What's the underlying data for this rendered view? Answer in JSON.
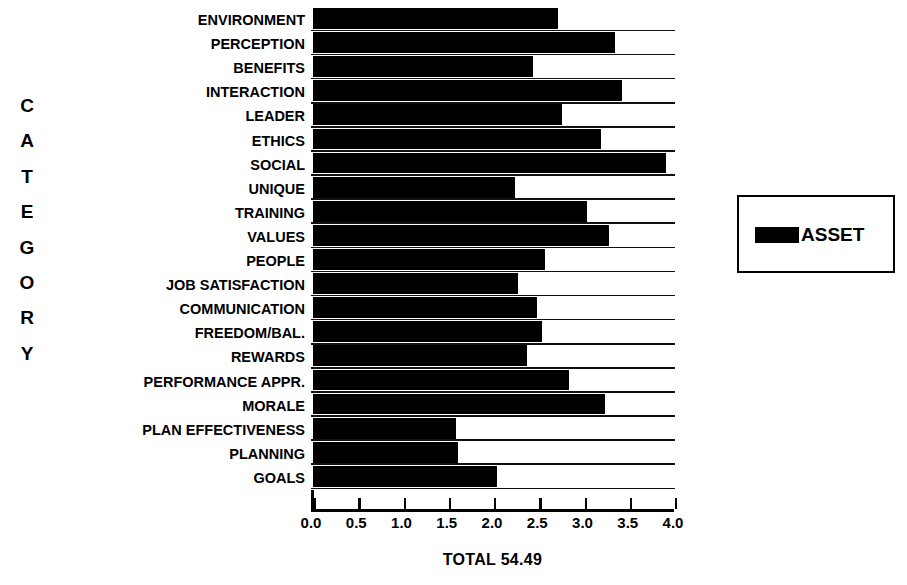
{
  "axis_titles": {
    "y_axis_title": "CATEGORY",
    "y_axis_title_letters": [
      "C",
      "A",
      "T",
      "E",
      "G",
      "O",
      "R",
      "Y"
    ]
  },
  "caption": {
    "total_label": "TOTAL 54.49"
  },
  "legend": {
    "position": "right",
    "entries": [
      {
        "label": "ASSET",
        "color": "#000000"
      }
    ],
    "label": "ASSET"
  },
  "colors": {
    "bar": "#000000",
    "background": "#ffffff",
    "axis": "#000000",
    "gridline": "#111111"
  },
  "chart_data": {
    "type": "bar",
    "orientation": "horizontal",
    "title": "",
    "subtitle": "",
    "xlabel": "",
    "ylabel": "CATEGORY",
    "xlim": [
      0.0,
      4.0
    ],
    "xticks": [
      "0.0",
      "0.5",
      "1.0",
      "1.5",
      "2.0",
      "2.5",
      "3.0",
      "3.5",
      "4.0"
    ],
    "xtick_values": [
      0.0,
      0.5,
      1.0,
      1.5,
      2.0,
      2.5,
      3.0,
      3.5,
      4.0
    ],
    "grid": true,
    "legend_position": "right",
    "annotations": [
      "TOTAL 54.49"
    ],
    "categories": [
      "ENVIRONMENT",
      "PERCEPTION",
      "BENEFITS",
      "INTERACTION",
      "LEADER",
      "ETHICS",
      "SOCIAL",
      "UNIQUE",
      "TRAINING",
      "VALUES",
      "PEOPLE",
      "JOB SATISFACTION",
      "COMMUNICATION",
      "FREEDOM/BAL.",
      "REWARDS",
      "PERFORMANCE APPR.",
      "MORALE",
      "PLAN EFFECTIVENESS",
      "PLANNING",
      "GOALS"
    ],
    "series": [
      {
        "name": "ASSET",
        "color": "#000000",
        "values": [
          2.71,
          3.34,
          2.43,
          3.41,
          2.75,
          3.18,
          3.9,
          2.23,
          3.03,
          3.27,
          2.56,
          2.27,
          2.48,
          2.53,
          2.36,
          2.83,
          3.23,
          1.58,
          1.6,
          2.03
        ]
      }
    ],
    "values": [
      2.71,
      3.34,
      2.43,
      3.41,
      2.75,
      3.18,
      3.9,
      2.23,
      3.03,
      3.27,
      2.56,
      2.27,
      2.48,
      2.53,
      2.36,
      2.83,
      3.23,
      1.58,
      1.6,
      2.03
    ],
    "total": 54.49
  }
}
